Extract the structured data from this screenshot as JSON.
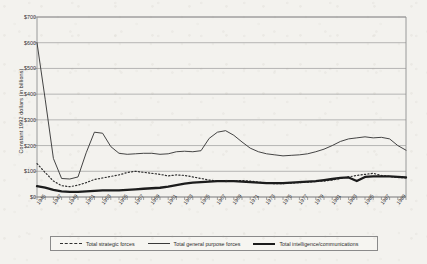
{
  "chart_data": {
    "type": "line",
    "title": "",
    "xlabel": "",
    "ylabel": "Constant 1992 dollars (in billions)",
    "ylim": [
      0,
      700
    ],
    "yticks": [
      0,
      100,
      200,
      300,
      400,
      500,
      600,
      700
    ],
    "ytick_labels": [
      "$0",
      "$100",
      "$200",
      "$300",
      "$400",
      "$500",
      "$600",
      "$700"
    ],
    "xlim": [
      1945,
      1990
    ],
    "grid": "horizontal",
    "legend_position": "bottom",
    "x": [
      1945,
      1946,
      1947,
      1948,
      1949,
      1950,
      1951,
      1952,
      1953,
      1954,
      1955,
      1956,
      1957,
      1958,
      1959,
      1960,
      1961,
      1962,
      1963,
      1964,
      1965,
      1966,
      1967,
      1968,
      1969,
      1970,
      1971,
      1972,
      1973,
      1974,
      1975,
      1976,
      1977,
      1978,
      1979,
      1980,
      1981,
      1982,
      1983,
      1984,
      1985,
      1986,
      1987,
      1988,
      1989,
      1990
    ],
    "xtick_labels": [
      "1945",
      "1947",
      "1949",
      "1951",
      "1953",
      "1955",
      "1957",
      "1959",
      "1961",
      "1963",
      "1965",
      "1967",
      "1969",
      "1971",
      "1973",
      "1975",
      "1977",
      "1979",
      "1981",
      "1983",
      "1985",
      "1987",
      "1989"
    ],
    "xtick_label_years": [
      1945,
      1947,
      1949,
      1951,
      1953,
      1955,
      1957,
      1959,
      1961,
      1963,
      1965,
      1967,
      1969,
      1971,
      1973,
      1975,
      1977,
      1979,
      1981,
      1983,
      1985,
      1987,
      1989
    ],
    "series": [
      {
        "name": "Total strategic forces",
        "style": "dashed",
        "color": "#303030",
        "values": [
          130,
          95,
          62,
          44,
          40,
          46,
          56,
          68,
          74,
          80,
          86,
          95,
          100,
          96,
          92,
          88,
          82,
          86,
          84,
          78,
          72,
          66,
          62,
          60,
          62,
          64,
          62,
          58,
          54,
          52,
          52,
          54,
          56,
          58,
          60,
          62,
          66,
          72,
          78,
          84,
          88,
          92,
          84,
          80,
          76,
          74
        ]
      },
      {
        "name": "Total general purpose forces",
        "style": "solid-thin",
        "color": "#3a3a3a",
        "values": [
          600,
          380,
          150,
          72,
          70,
          78,
          172,
          252,
          248,
          196,
          170,
          166,
          168,
          170,
          170,
          166,
          168,
          176,
          178,
          176,
          180,
          228,
          252,
          258,
          240,
          214,
          190,
          176,
          168,
          164,
          160,
          162,
          164,
          168,
          176,
          186,
          200,
          216,
          226,
          230,
          234,
          230,
          232,
          226,
          200,
          182
        ]
      },
      {
        "name": "Total intelligence/communications",
        "style": "solid-thick",
        "color": "#1c1c1c",
        "values": [
          42,
          36,
          28,
          22,
          20,
          20,
          22,
          24,
          26,
          26,
          26,
          28,
          30,
          32,
          34,
          36,
          40,
          46,
          52,
          56,
          58,
          60,
          62,
          62,
          62,
          60,
          58,
          56,
          54,
          54,
          54,
          56,
          58,
          60,
          62,
          66,
          70,
          74,
          76,
          62,
          78,
          80,
          80,
          80,
          78,
          76
        ]
      }
    ]
  },
  "legend": {
    "items": [
      {
        "label": "Total strategic forces",
        "swatch": "dashed-line-swatch"
      },
      {
        "label": "Total general purpose forces",
        "swatch": "thin-line-swatch"
      },
      {
        "label": "Total intelligence/communications",
        "swatch": "thick-line-swatch"
      }
    ]
  }
}
